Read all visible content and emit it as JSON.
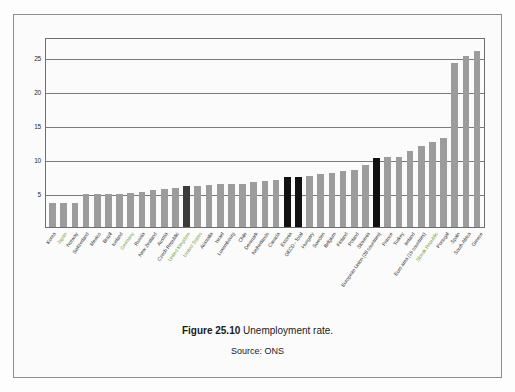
{
  "figure": {
    "caption_prefix": "Figure 25.10",
    "caption_text": "Unemployment rate.",
    "source": "Source: ONS"
  },
  "colors": {
    "bar_default": "#9c9c9c",
    "bar_dark": "#3b3b3b",
    "bar_black": "#111111",
    "label_green": "#76a04a",
    "axis": "#6f6f6f",
    "grid": "#7a7a7a",
    "page_background": "#fdfdfd",
    "box_border": "#8d8d8d"
  },
  "chart_data": {
    "type": "bar",
    "title": "Unemployment rate",
    "xlabel": "",
    "ylabel": "",
    "ylim": [
      0,
      28
    ],
    "yticks": [
      5,
      10,
      15,
      20,
      25
    ],
    "grid": true,
    "legend": "none",
    "categories": [
      "Korea",
      "Japan",
      "Norway",
      "Switzerland",
      "Mexico",
      "Brazil",
      "Iceland",
      "Germany",
      "Russia",
      "New Zealand",
      "Austria",
      "Czech Republic",
      "United Kingdom",
      "United States",
      "Australia",
      "Israel",
      "Luxembourg",
      "Chile",
      "Denmark",
      "Netherlands",
      "Canada",
      "Estonia",
      "OECD - Total",
      "Hungary",
      "Sweden",
      "Belgium",
      "Finland",
      "Poland",
      "Slovenia",
      "European Union (28 countries)",
      "France",
      "Turkey",
      "Ireland",
      "Euro area (19 countries)",
      "Slovak Republic",
      "Portugal",
      "Spain",
      "South Africa",
      "Greece"
    ],
    "values": [
      3.5,
      3.5,
      3.6,
      4.9,
      4.9,
      4.9,
      4.9,
      5.0,
      5.1,
      5.4,
      5.6,
      5.8,
      6.1,
      6.1,
      6.2,
      6.3,
      6.3,
      6.4,
      6.6,
      6.8,
      6.9,
      7.3,
      7.3,
      7.5,
      7.8,
      8.0,
      8.2,
      8.4,
      9.2,
      10.2,
      10.3,
      10.3,
      11.2,
      11.9,
      12.6,
      13.1,
      24.1,
      25.2,
      26.0
    ],
    "highlights": {
      "United Kingdom": "dark",
      "OECD - Total": "black",
      "Estonia": "black",
      "European Union (28 countries)": "black"
    },
    "green_labels": [
      "Japan",
      "Germany",
      "United Kingdom",
      "United States",
      "Slovak Republic"
    ]
  }
}
